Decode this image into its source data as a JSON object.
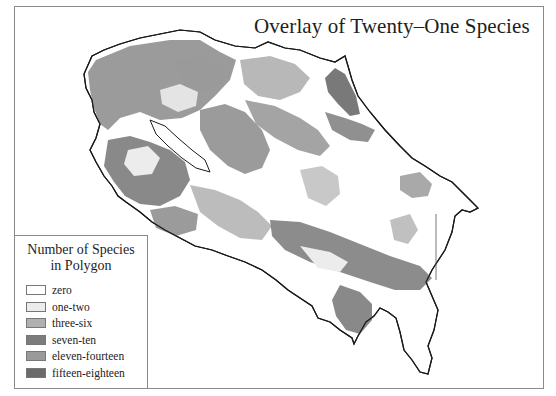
{
  "map": {
    "title": "Overlay of Twenty–One Species",
    "legend": {
      "title_line1": "Number of Species",
      "title_line2": "in Polygon",
      "items": [
        {
          "label": "zero",
          "color": "#ffffff"
        },
        {
          "label": "one-two",
          "color": "#ececec"
        },
        {
          "label": "three-six",
          "color": "#b0b0b0"
        },
        {
          "label": "seven-ten",
          "color": "#7c7c7c"
        },
        {
          "label": "eleven-fourteen",
          "color": "#9a9a9a"
        },
        {
          "label": "fifteen-eighteen",
          "color": "#6a6a6a"
        }
      ]
    }
  }
}
